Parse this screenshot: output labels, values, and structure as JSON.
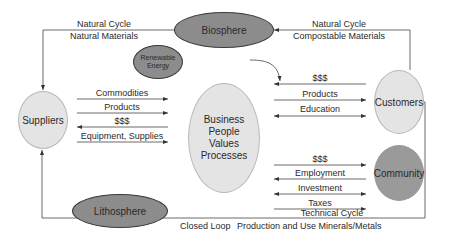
{
  "nodes": {
    "biosphere": "Biosphere",
    "renewable_energy_line1": "Renewable",
    "renewable_energy_line2": "Energy",
    "suppliers": "Suppliers",
    "business": [
      "Business",
      "People",
      "Values",
      "Processes"
    ],
    "customers": "Customers",
    "community": "Community",
    "lithosphere": "Lithosphere"
  },
  "cycles": {
    "natural_left": {
      "title": "Natural Cycle",
      "subtitle": "Natural Materials"
    },
    "natural_right": {
      "title": "Natural Cycle",
      "subtitle": "Compostable Materials"
    },
    "technical": {
      "title": "Technical Cycle",
      "subtitle_left": "Closed Loop",
      "subtitle_right": "Production and Use Minerals/Metals"
    }
  },
  "flows": {
    "suppliers": [
      {
        "label": "Commodities",
        "direction": "to-business"
      },
      {
        "label": "Products",
        "direction": "to-business"
      },
      {
        "label": "$$$",
        "direction": "to-suppliers"
      },
      {
        "label": "Equipment, Supplies",
        "direction": "to-business"
      }
    ],
    "customers": [
      {
        "label": "$$$",
        "direction": "to-business"
      },
      {
        "label": "Products",
        "direction": "to-customers"
      },
      {
        "label": "Education",
        "direction": "both"
      }
    ],
    "community": [
      {
        "label": "$$$",
        "direction": "to-community"
      },
      {
        "label": "Employment",
        "direction": "to-business"
      },
      {
        "label": "Investment",
        "direction": "both"
      },
      {
        "label": "Taxes",
        "direction": "to-community"
      }
    ]
  },
  "colors": {
    "light_node": "#e4e4e4",
    "dark_node": "#8c8c8c",
    "community_node": "#9a9a9a",
    "line": "#3a3a3a"
  }
}
